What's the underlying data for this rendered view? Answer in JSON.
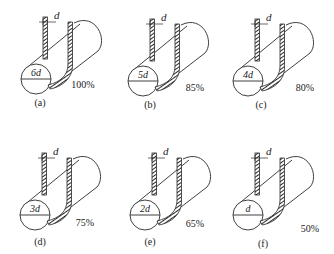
{
  "figure": {
    "rope_diameter_label": "d",
    "colors": {
      "line": "#2a2a2a",
      "background": "#ffffff"
    },
    "panels": [
      {
        "id": "a",
        "label": "(a)",
        "diameter_label": "6d",
        "efficiency": "100%",
        "x": 0,
        "y": 0,
        "pct_x": 83,
        "pct_y": 88,
        "lab_x": 40,
        "lab_y": 106
      },
      {
        "id": "b",
        "label": "(b)",
        "diameter_label": "5d",
        "efficiency": "85%",
        "x": 107,
        "y": 2,
        "pct_x": 195,
        "pct_y": 91,
        "lab_x": 150,
        "lab_y": 108
      },
      {
        "id": "c",
        "label": "(c)",
        "diameter_label": "4d",
        "efficiency": "80%",
        "x": 212,
        "y": 2,
        "pct_x": 305,
        "pct_y": 91,
        "lab_x": 261,
        "lab_y": 108
      },
      {
        "id": "d",
        "label": "(d)",
        "diameter_label": "3d",
        "efficiency": "75%",
        "x": -1,
        "y": 136,
        "pct_x": 85,
        "pct_y": 226,
        "lab_x": 40,
        "lab_y": 245
      },
      {
        "id": "e",
        "label": "(e)",
        "diameter_label": "2d",
        "efficiency": "65%",
        "x": 109,
        "y": 136,
        "pct_x": 195,
        "pct_y": 227,
        "lab_x": 150,
        "lab_y": 245
      },
      {
        "id": "f",
        "label": "(f)",
        "diameter_label": "d",
        "efficiency": "50%",
        "x": 212,
        "y": 136,
        "pct_x": 310,
        "pct_y": 232,
        "lab_x": 263,
        "lab_y": 247
      }
    ]
  }
}
